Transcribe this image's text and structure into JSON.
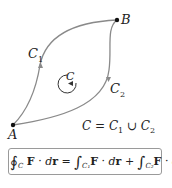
{
  "diagram": {
    "curve_color": "#8a8a8a",
    "points": {
      "A": {
        "label": "A",
        "x": 13,
        "y": 125
      },
      "B": {
        "label": "B",
        "x": 117,
        "y": 20
      }
    },
    "curves": {
      "C1": {
        "label": "C",
        "sub": "1"
      },
      "C2": {
        "label": "C",
        "sub": "2"
      }
    },
    "orientation_label": "C",
    "union_text": {
      "lhs": "C",
      "eq": " = ",
      "c1": "C",
      "c1sub": "1",
      "cup": " ∪ ",
      "c2": "C",
      "c2sub": "2"
    },
    "formula": {
      "oint": "∮",
      "oint_sub": "C",
      "F": "F",
      "dot": " · ",
      "dr_d": "d",
      "dr_r": "r",
      "eq": " = ",
      "int": "∫",
      "int1_sub": "C₁",
      "plus": " + ",
      "int2_sub": "C₂"
    }
  }
}
